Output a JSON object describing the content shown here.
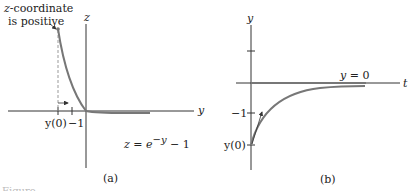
{
  "panel_a": {
    "annotation_line1": "z-coordinate",
    "annotation_line2": "is positive",
    "vertical_axis": "z",
    "horizontal_axis": "y",
    "tick_y0": "y(0)",
    "tick_neg1": "−1",
    "equation": "z = e",
    "equation_exp": "−y",
    "equation_tail": " − 1",
    "caption": "(a)"
  },
  "panel_b": {
    "vertical_axis": "y",
    "horizontal_axis": "t",
    "equilibrium_label": "y = 0",
    "tick_neg1": "−1",
    "tick_y0": "y(0)",
    "caption": "(b)"
  },
  "figure_caption_partial": "Figure",
  "colors": {
    "axis": "#333333",
    "curve": "#777777",
    "text": "#222222",
    "dashed": "#999999"
  }
}
